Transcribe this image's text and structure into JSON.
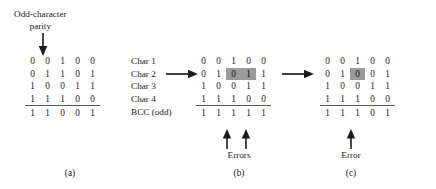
{
  "figure": {
    "callout": {
      "line1": "Odd-character",
      "line2": "parity",
      "arrow_icon": "down-arrow-icon"
    },
    "row_labels": {
      "char1": "Char 1",
      "char2": "Char 2",
      "char3": "Char 3",
      "char4": "Char 4",
      "bcc": "BCC (odd)"
    },
    "transition_arrow_icon": "right-arrow-icon",
    "error_arrow_icon": "up-arrow-icon",
    "panels": [
      {
        "id": "a",
        "caption": "(a)",
        "rows": [
          {
            "name": "char1",
            "bits": [
              "0",
              "0",
              "1",
              "0",
              "0"
            ],
            "highlight": []
          },
          {
            "name": "char2",
            "bits": [
              "0",
              "1",
              "1",
              "0",
              "1"
            ],
            "highlight": []
          },
          {
            "name": "char3",
            "bits": [
              "1",
              "0",
              "0",
              "1",
              "1"
            ],
            "highlight": []
          },
          {
            "name": "char4",
            "bits": [
              "1",
              "1",
              "1",
              "0",
              "0"
            ],
            "highlight": []
          },
          {
            "name": "bcc",
            "bits": [
              "1",
              "1",
              "0",
              "0",
              "1"
            ],
            "highlight": []
          }
        ],
        "annotation": "",
        "error_columns": []
      },
      {
        "id": "b",
        "caption": "(b)",
        "rows": [
          {
            "name": "char1",
            "bits": [
              "0",
              "0",
              "1",
              "0",
              "0"
            ],
            "highlight": []
          },
          {
            "name": "char2",
            "bits": [
              "0",
              "1",
              "0",
              "1",
              "1"
            ],
            "highlight": [
              2,
              3
            ]
          },
          {
            "name": "char3",
            "bits": [
              "1",
              "0",
              "0",
              "1",
              "1"
            ],
            "highlight": []
          },
          {
            "name": "char4",
            "bits": [
              "1",
              "1",
              "1",
              "0",
              "0"
            ],
            "highlight": []
          },
          {
            "name": "bcc",
            "bits": [
              "1",
              "1",
              "1",
              "1",
              "1"
            ],
            "highlight": []
          }
        ],
        "annotation": "Errors",
        "error_columns": [
          2,
          3
        ]
      },
      {
        "id": "c",
        "caption": "(c)",
        "rows": [
          {
            "name": "char1",
            "bits": [
              "0",
              "0",
              "1",
              "0",
              "0"
            ],
            "highlight": []
          },
          {
            "name": "char2",
            "bits": [
              "0",
              "1",
              "0",
              "0",
              "1"
            ],
            "highlight": [
              2
            ]
          },
          {
            "name": "char3",
            "bits": [
              "1",
              "0",
              "0",
              "1",
              "1"
            ],
            "highlight": []
          },
          {
            "name": "char4",
            "bits": [
              "1",
              "1",
              "1",
              "0",
              "0"
            ],
            "highlight": []
          },
          {
            "name": "bcc",
            "bits": [
              "1",
              "1",
              "1",
              "0",
              "1"
            ],
            "highlight": []
          }
        ],
        "annotation": "Error",
        "error_columns": [
          2
        ]
      }
    ],
    "colors": {
      "highlight": "#9a9a9a",
      "text": "#1b1b1b",
      "rule": "#555555"
    }
  }
}
